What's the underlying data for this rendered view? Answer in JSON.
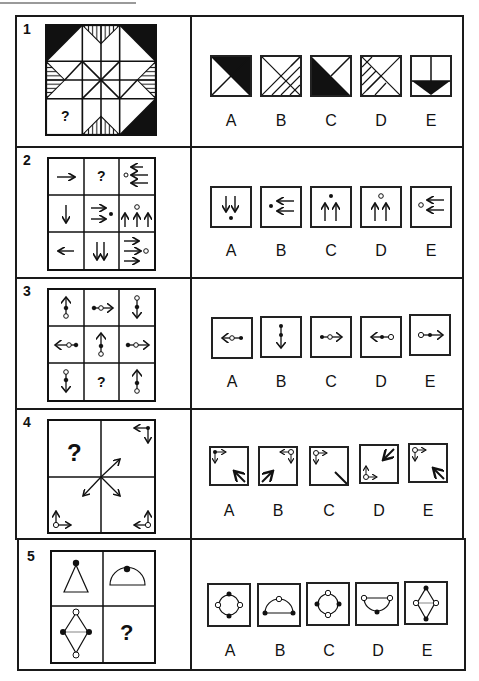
{
  "questions": [
    {
      "number": "1",
      "missing_mark": "?",
      "options": [
        {
          "label": "A",
          "description": "square with X, top and right triangles black"
        },
        {
          "label": "B",
          "description": "square with X, right and bottom triangles hatched diagonally"
        },
        {
          "label": "C",
          "description": "square with X, left and bottom triangles black"
        },
        {
          "label": "D",
          "description": "square with X, left and bottom triangles hatched diagonally"
        },
        {
          "label": "E",
          "description": "square split vertically with black downward triangle at bottom"
        }
      ]
    },
    {
      "number": "2",
      "missing_mark": "?",
      "grid": [
        [
          "right-arrow",
          "?",
          "three-left-arrows-open-dot"
        ],
        [
          "down-arrow",
          "two-right-arrows-filled-dot",
          "three-up-arrows-open-dot"
        ],
        [
          "left-arrow",
          "two-down-arrows",
          "three-right-arrows-open-dot"
        ]
      ],
      "options": [
        {
          "label": "A",
          "description": "two down arrows with filled dot below"
        },
        {
          "label": "B",
          "description": "filled dot with two left arrows"
        },
        {
          "label": "C",
          "description": "two up arrows with filled dot above"
        },
        {
          "label": "D",
          "description": "two up arrows with open dot above"
        },
        {
          "label": "E",
          "description": "open dot with two left arrows"
        }
      ]
    },
    {
      "number": "3",
      "missing_mark": "?",
      "options": [
        {
          "label": "A",
          "description": "left arrow, open dot then filled dot"
        },
        {
          "label": "B",
          "description": "down arrow with two filled dots"
        },
        {
          "label": "C",
          "description": "right arrow, filled dot then open dot"
        },
        {
          "label": "D",
          "description": "left arrow, filled dot then open dot"
        },
        {
          "label": "E",
          "description": "right arrow, open dot then filled dot"
        }
      ]
    },
    {
      "number": "4",
      "missing_mark": "?",
      "options": [
        {
          "label": "A",
          "description": "filled corner marker top-left, arrow bottom-right pointing up-left"
        },
        {
          "label": "B",
          "description": "open marker top-right, arrow bottom-left pointing up-right"
        },
        {
          "label": "C",
          "description": "open marker top-left, line bottom-right"
        },
        {
          "label": "D",
          "description": "open marker bottom-left, arrow top-right pointing down-left"
        },
        {
          "label": "E",
          "description": "open marker top-left, arrow bottom-right pointing up-left"
        }
      ]
    },
    {
      "number": "5",
      "missing_mark": "?",
      "options": [
        {
          "label": "A",
          "description": "circle with filled dots top/bottom, open dots left/right"
        },
        {
          "label": "B",
          "description": "semicircle with open dot top, filled dots at ends"
        },
        {
          "label": "C",
          "description": "circle with open dots top/bottom, filled dots left/right"
        },
        {
          "label": "D",
          "description": "inverted semicircle with open dots at ends, filled dot bottom"
        },
        {
          "label": "E",
          "description": "diamond with filled dots top/bottom, open dots left/right"
        }
      ]
    }
  ]
}
